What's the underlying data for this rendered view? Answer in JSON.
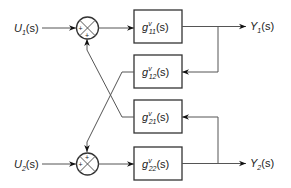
{
  "diagram": {
    "type": "block-diagram",
    "inputs": [
      {
        "id": "u1",
        "main": "U",
        "sub": "1",
        "tail": "(s)"
      },
      {
        "id": "u2",
        "main": "U",
        "sub": "2",
        "tail": "(s)"
      }
    ],
    "outputs": [
      {
        "id": "y1",
        "main": "Y",
        "sub": "1",
        "tail": "(s)"
      },
      {
        "id": "y2",
        "main": "Y",
        "sub": "2",
        "tail": "(s)"
      }
    ],
    "blocks": [
      {
        "id": "g11",
        "main": "g",
        "sup": "v",
        "sub": "11",
        "tail": "(s)"
      },
      {
        "id": "g12",
        "main": "g",
        "sup": "v",
        "sub": "12",
        "tail": "(s)"
      },
      {
        "id": "g21",
        "main": "g",
        "sup": "v",
        "sub": "21",
        "tail": "(s)"
      },
      {
        "id": "g22",
        "main": "g",
        "sup": "v",
        "sub": "22",
        "tail": "(s)"
      }
    ],
    "summing_junctions": [
      {
        "id": "sum1",
        "signs": [
          "+",
          "+"
        ]
      },
      {
        "id": "sum2",
        "signs": [
          "+",
          "+"
        ]
      }
    ],
    "connections": [
      "U1 -> sum1",
      "sum1 -> g11",
      "g11 -> Y1",
      "Y1 -> g12",
      "g12 -> sum2",
      "U2 -> sum2",
      "sum2 -> g22",
      "g22 -> Y2",
      "Y2 -> g21",
      "g21 -> sum1"
    ]
  }
}
